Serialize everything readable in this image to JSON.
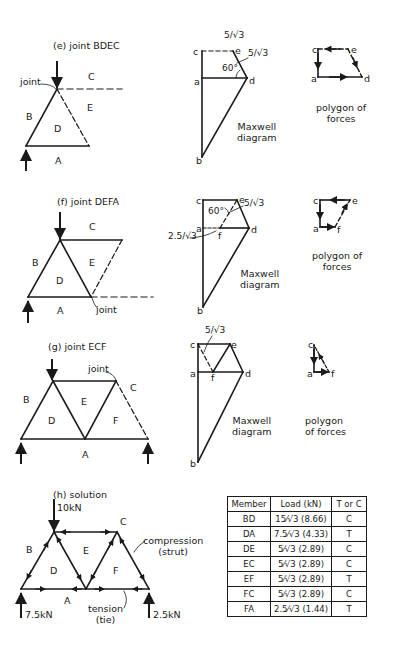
{
  "sections": {
    "e": {
      "title": "(e) joint  BDEC",
      "truss_labels": {
        "joint": "joint",
        "B": "B",
        "C": "C",
        "D": "D",
        "E": "E",
        "A": "A"
      },
      "maxwell": {
        "points": {
          "c": "c",
          "e": "e",
          "a": "a",
          "d": "d",
          "b": "b"
        },
        "angle": "60°",
        "value_top": "5/√3",
        "value_side": "5/√3",
        "caption_line1": "Maxwell",
        "caption_line2": "diagram"
      },
      "polygon": {
        "points": {
          "c": "c",
          "e": "e",
          "a": "a",
          "d": "d"
        },
        "caption_line1": "polygon of",
        "caption_line2": "forces"
      }
    },
    "f": {
      "title": "(f) joint  DEFA",
      "truss_labels": {
        "joint": "joint",
        "B": "B",
        "C": "C",
        "D": "D",
        "E": "E",
        "A": "A"
      },
      "maxwell": {
        "points": {
          "c": "c",
          "e": "e",
          "a": "a",
          "f": "f",
          "d": "d",
          "b": "b"
        },
        "angle": "60°",
        "value_right": "5/√3",
        "value_left": "2.5/√3",
        "caption_line1": "Maxwell",
        "caption_line2": "diagram"
      },
      "polygon": {
        "points": {
          "c": "c",
          "e": "e",
          "a": "a",
          "f": "f"
        },
        "caption_line1": "polygon of",
        "caption_line2": "forces"
      }
    },
    "g": {
      "title": "(g) joint  ECF",
      "truss_labels": {
        "joint": "joint",
        "B": "B",
        "C": "C",
        "D": "D",
        "E": "E",
        "F": "F",
        "A": "A"
      },
      "maxwell": {
        "points": {
          "c": "c",
          "e": "e",
          "a": "a",
          "f": "f",
          "d": "d",
          "b": "b"
        },
        "value_top": "5/√3",
        "caption_line1": "Maxwell",
        "caption_line2": "diagram"
      },
      "polygon": {
        "points": {
          "c": "c",
          "a": "a",
          "f": "f"
        },
        "caption_line1": "polygon",
        "caption_line2": "of forces"
      }
    },
    "h": {
      "title": "(h) solution",
      "load_top": "10kN",
      "reaction_left": "7.5kN",
      "reaction_right": "2.5kN",
      "truss_labels": {
        "B": "B",
        "C": "C",
        "D": "D",
        "E": "E",
        "F": "F",
        "A": "A"
      },
      "compression_line1": "compression",
      "compression_line2": "(strut)",
      "tension_line1": "tension",
      "tension_line2": "(tie)"
    }
  },
  "table": {
    "headers": [
      "Member",
      "Load (kN)",
      "T or C"
    ],
    "rows": [
      {
        "member": "BD",
        "load": "15⁄√3 (8.66)",
        "type": "C"
      },
      {
        "member": "DA",
        "load": "7.5⁄√3 (4.33)",
        "type": "T"
      },
      {
        "member": "DE",
        "load": "5⁄√3 (2.89)",
        "type": "C"
      },
      {
        "member": "EC",
        "load": "5⁄√3 (2.89)",
        "type": "C"
      },
      {
        "member": "EF",
        "load": "5⁄√3 (2.89)",
        "type": "T"
      },
      {
        "member": "FC",
        "load": "5⁄√3 (2.89)",
        "type": "C"
      },
      {
        "member": "FA",
        "load": "2.5⁄√3 (1.44)",
        "type": "T"
      }
    ]
  },
  "colors": {
    "ink": "#1a1a1a",
    "background": "#ffffff"
  }
}
